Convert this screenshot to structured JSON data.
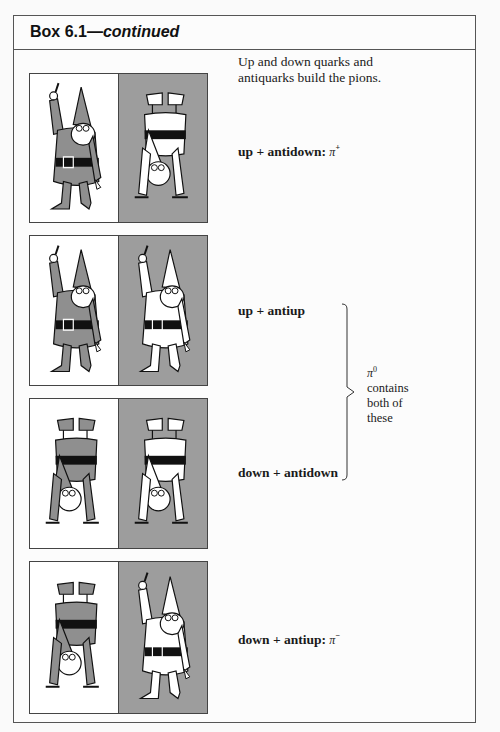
{
  "box": {
    "title_number": "Box 6.1",
    "title_dash": "—",
    "title_suffix": "continued"
  },
  "intro": {
    "line1": "Up and down quarks and",
    "line2": "antiquarks build the pions."
  },
  "rows": [
    {
      "label": "up + antidown:",
      "particle": "π",
      "charge": "+",
      "left_gnome": {
        "color": "gray",
        "orientation": "upright",
        "background": "white"
      },
      "right_gnome": {
        "color": "white",
        "orientation": "upside-down",
        "background": "gray"
      }
    },
    {
      "label": "up + antiup",
      "left_gnome": {
        "color": "gray",
        "orientation": "upright",
        "background": "white"
      },
      "right_gnome": {
        "color": "white",
        "orientation": "upright",
        "background": "gray"
      }
    },
    {
      "label": "down + antidown",
      "left_gnome": {
        "color": "gray",
        "orientation": "upside-down",
        "background": "white"
      },
      "right_gnome": {
        "color": "white",
        "orientation": "upside-down",
        "background": "gray"
      }
    },
    {
      "label": "down + antiup:",
      "particle": "π",
      "charge": "−",
      "left_gnome": {
        "color": "gray",
        "orientation": "upside-down",
        "background": "white"
      },
      "right_gnome": {
        "color": "white",
        "orientation": "upright",
        "background": "gray"
      }
    }
  ],
  "pi_zero_note": {
    "symbol": "π",
    "charge": "0",
    "line1": "contains",
    "line2": "both of",
    "line3": "these"
  },
  "colors": {
    "gray_panel": "#9d9d9d",
    "gnome_gray": "#8f8f8f",
    "gnome_white": "#ffffff",
    "belt": "#111111"
  }
}
